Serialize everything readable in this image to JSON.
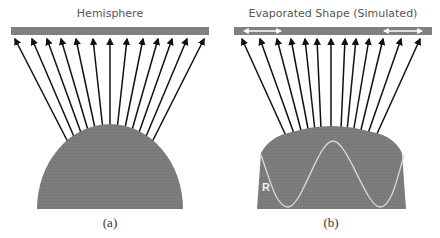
{
  "panels": [
    {
      "id": "a",
      "title": "Hemisphere",
      "caption": "(a)",
      "shape": "hemisphere",
      "colors": {
        "substrate": "#808080",
        "shape": "#7f7f7f",
        "arrows": "#111111"
      }
    },
    {
      "id": "b",
      "title": "Evaporated Shape (Simulated)",
      "caption": "(b)",
      "shape": "truncated-dome",
      "curve_label": "R",
      "colors": {
        "substrate": "#808080",
        "shape": "#7f7f7f",
        "arrows": "#111111",
        "curve": "#d8d8d8",
        "double_arrows": "#ffffff"
      }
    }
  ]
}
